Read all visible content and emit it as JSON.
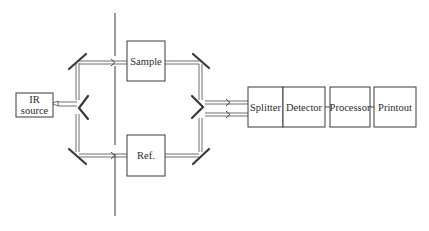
{
  "diagram": {
    "type": "double-beam IR spectrometer schematic",
    "colors": {
      "line": "#3a3a3a",
      "background": "#ffffff"
    },
    "boxes": {
      "ir_source": {
        "line1": "IR",
        "line2": "source"
      },
      "sample": "Sample",
      "reference": "Ref.",
      "splitter": "Splitter",
      "detector": "Detector",
      "processor": "Processor",
      "printout": "Printout"
    },
    "flow": [
      "IR source",
      "Sample / Ref.",
      "Splitter",
      "Detector",
      "Processor",
      "Printout"
    ]
  }
}
